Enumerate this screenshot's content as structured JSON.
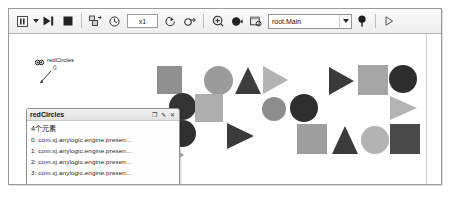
{
  "window": {
    "title": ""
  },
  "toolbar": {
    "buttons": [
      {
        "name": "pause-button",
        "icon": "pause-icon",
        "label": "Pause"
      },
      {
        "name": "run-dropdown-arrow",
        "icon": "chevron-down-icon",
        "label": ""
      },
      {
        "name": "step-button",
        "icon": "step-forward-icon",
        "label": "Step"
      },
      {
        "name": "stop-button",
        "icon": "stop-square-icon",
        "label": "Stop"
      },
      {
        "name": "run-slow-button",
        "icon": "run-slow-icon",
        "label": "Run Slow"
      },
      {
        "name": "virtual-time-button",
        "icon": "clock-icon",
        "label": "Virtual Time"
      },
      {
        "name": "speed-up-button",
        "icon": "speed-up-icon",
        "label": "Speed Up"
      },
      {
        "name": "speed-down-button",
        "icon": "speed-down-icon",
        "label": "Slow Down"
      },
      {
        "name": "navigate-button",
        "icon": "navigate-icon",
        "label": "Navigate"
      },
      {
        "name": "marker-button",
        "icon": "filled-marker-icon",
        "label": "Marker"
      },
      {
        "name": "inspect-button",
        "icon": "inspect-window-icon",
        "label": "Inspect"
      },
      {
        "name": "pin-button",
        "icon": "pin-icon",
        "label": "Pin"
      },
      {
        "name": "play-button",
        "icon": "play-triangle-icon",
        "label": "Run"
      }
    ],
    "speed_value": "x1",
    "root_selector": {
      "value": "root.Main",
      "arrow": "▼"
    }
  },
  "annotation": {
    "label": "redCircles",
    "sublabel": "()",
    "icon": "collection-icon"
  },
  "inspector": {
    "title": "redCircles",
    "count_label": "4个元素",
    "controls": [
      {
        "name": "inspector-restore-button",
        "glyph": "❐"
      },
      {
        "name": "inspector-edit-button",
        "glyph": "✎"
      },
      {
        "name": "inspector-close-button",
        "glyph": "✕"
      }
    ],
    "rows": [
      {
        "index": "0:",
        "value": "com.xj.anylogic.engine.presen..."
      },
      {
        "index": "1:",
        "value": "com.xj.anylogic.engine.presen..."
      },
      {
        "index": "2:",
        "value": "com.xj.anylogic.engine.presen..."
      },
      {
        "index": "3:",
        "value": "com.xj.anylogic.engine.presen..."
      }
    ]
  },
  "colors": {
    "dark": "#3a3a3a",
    "mid": "#8f8f8f",
    "light": "#b0b0b0",
    "lighter": "#c2c2c2",
    "canvas": "#ffffff"
  },
  "canvas": {
    "shapes": [
      {
        "name": "shape-square-1",
        "type": "square",
        "x": 148,
        "y": 32,
        "w": 25,
        "h": 28,
        "color": "#8f8f8f"
      },
      {
        "name": "shape-circle-1",
        "type": "circle",
        "x": 195,
        "y": 32,
        "w": 29,
        "h": 29,
        "color": "#9b9b9b"
      },
      {
        "name": "shape-triangle-1",
        "type": "triangle",
        "x": 226,
        "y": 33,
        "w": 26,
        "h": 27,
        "color": "#3d3d3d"
      },
      {
        "name": "shape-triangle-2",
        "type": "triangle-right",
        "x": 254,
        "y": 32,
        "w": 25,
        "h": 28,
        "color": "#b3b3b3"
      },
      {
        "name": "shape-triangle-3",
        "type": "triangle-right",
        "x": 320,
        "y": 33,
        "w": 25,
        "h": 28,
        "color": "#3a3a3a"
      },
      {
        "name": "shape-square-2",
        "type": "square",
        "x": 349,
        "y": 31,
        "w": 30,
        "h": 30,
        "color": "#a5a5a5"
      },
      {
        "name": "shape-circle-2",
        "type": "circle",
        "x": 380,
        "y": 31,
        "w": 28,
        "h": 28,
        "color": "#2e2e2e"
      },
      {
        "name": "shape-circle-3",
        "type": "circle",
        "x": 160,
        "y": 59,
        "w": 27,
        "h": 27,
        "color": "#333333"
      },
      {
        "name": "shape-square-3",
        "type": "square",
        "x": 186,
        "y": 60,
        "w": 28,
        "h": 28,
        "color": "#aeaeae"
      },
      {
        "name": "shape-circle-4",
        "type": "circle",
        "x": 253,
        "y": 63,
        "w": 24,
        "h": 24,
        "color": "#8d8d8d"
      },
      {
        "name": "shape-circle-5",
        "type": "circle",
        "x": 281,
        "y": 60,
        "w": 28,
        "h": 28,
        "color": "#2f2f2f"
      },
      {
        "name": "shape-triangle-4",
        "type": "triangle-right",
        "x": 381,
        "y": 62,
        "w": 27,
        "h": 25,
        "color": "#b4b4b4"
      },
      {
        "name": "shape-circle-6",
        "type": "circle",
        "x": 160,
        "y": 86,
        "w": 27,
        "h": 27,
        "color": "#303030"
      },
      {
        "name": "shape-triangle-5",
        "type": "triangle-right",
        "x": 218,
        "y": 89,
        "w": 27,
        "h": 26,
        "color": "#3b3b3b"
      },
      {
        "name": "shape-square-4",
        "type": "square",
        "x": 288,
        "y": 90,
        "w": 30,
        "h": 30,
        "color": "#9e9e9e"
      },
      {
        "name": "shape-triangle-6",
        "type": "triangle",
        "x": 323,
        "y": 92,
        "w": 27,
        "h": 28,
        "color": "#3b3b3b"
      },
      {
        "name": "shape-circle-7",
        "type": "circle",
        "x": 352,
        "y": 92,
        "w": 28,
        "h": 28,
        "color": "#b3b3b3"
      },
      {
        "name": "shape-square-5",
        "type": "square",
        "x": 381,
        "y": 90,
        "w": 30,
        "h": 30,
        "color": "#4a4a4a"
      }
    ]
  }
}
